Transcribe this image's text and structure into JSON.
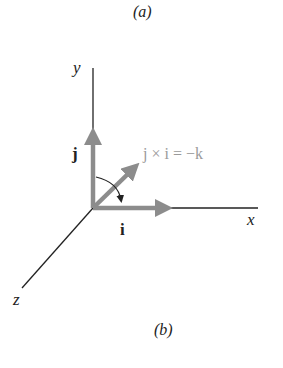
{
  "figure": {
    "top_caption": "(a)",
    "bottom_caption": "(b)"
  },
  "axes": {
    "x_label": "x",
    "y_label": "y",
    "z_label": "z"
  },
  "vectors": {
    "i_label": "i",
    "j_label": "j",
    "result_label": "j × i = −k"
  },
  "colors": {
    "axis": "#222222",
    "vector": "#8c8c8c",
    "result_text": "#9a9a9a"
  }
}
